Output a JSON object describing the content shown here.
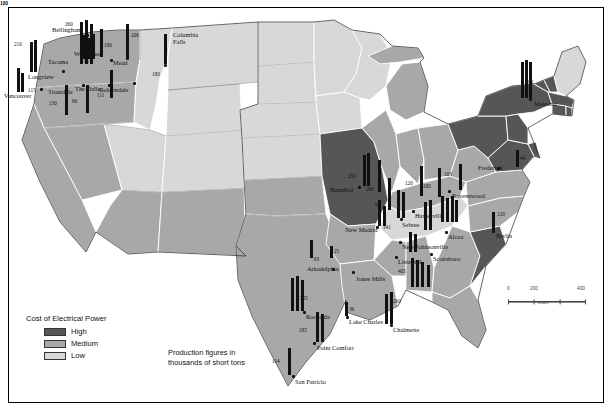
{
  "map": {
    "title": "US production map with electrical power cost choropleth",
    "legend": {
      "title": "Cost of Electrical Power",
      "items": [
        {
          "label": "High",
          "color": "#565656"
        },
        {
          "label": "Medium",
          "color": "#a8a8a8"
        },
        {
          "label": "Low",
          "color": "#d8d8d8"
        }
      ]
    },
    "note_lines": [
      "Production figures in",
      "thousands of short tons"
    ],
    "scale": {
      "ticks": [
        "0",
        "200",
        "400"
      ],
      "unit": "miles"
    },
    "colors": {
      "high": "#565656",
      "medium": "#a8a8a8",
      "low": "#d8d8d8",
      "border": "#ffffff",
      "outline": "#111111",
      "bar": "#111111",
      "water": "#ffffff"
    }
  },
  "cities": [
    {
      "name": "Bellingham",
      "x": 52,
      "y": 26,
      "dot_x": 86,
      "dot_y": 34,
      "anchor": "right"
    },
    {
      "name": "Longview",
      "x": 28,
      "y": 73,
      "dot_x": 62,
      "dot_y": 70,
      "anchor": "right"
    },
    {
      "name": "Vancouver",
      "x": 4,
      "y": 92,
      "dot_x": 40,
      "dot_y": 88,
      "anchor": "right"
    },
    {
      "name": "Tacoma",
      "x": 48,
      "y": 58,
      "dot_x": 80,
      "dot_y": 58,
      "anchor": "right"
    },
    {
      "name": "Troutdale",
      "x": 48,
      "y": 88,
      "dot_x": 82,
      "dot_y": 84,
      "anchor": "right"
    },
    {
      "name": "Wenatchee",
      "x": 74,
      "y": 50,
      "dot_x": 126,
      "dot_y": 57,
      "anchor": "left"
    },
    {
      "name": "Mead",
      "x": 113,
      "y": 59,
      "dot_x": 110,
      "dot_y": 59,
      "anchor": "left"
    },
    {
      "name": "The Dalles",
      "x": 75,
      "y": 85,
      "dot_x": 108,
      "dot_y": 84,
      "anchor": "left"
    },
    {
      "name": "Goldendale",
      "x": 99,
      "y": 86,
      "dot_x": 133,
      "dot_y": 82,
      "anchor": "left"
    },
    {
      "name": "Columbia Falls",
      "x": 173,
      "y": 31,
      "dot_x": 164,
      "dot_y": 64,
      "anchor": "left"
    },
    {
      "name": "Massena",
      "x": 534,
      "y": 100,
      "dot_x": 529,
      "dot_y": 98,
      "anchor": "left"
    },
    {
      "name": "Frederick",
      "x": 478,
      "y": 164,
      "dot_x": 497,
      "dot_y": 167,
      "anchor": "left"
    },
    {
      "name": "Ravenswood",
      "x": 452,
      "y": 192,
      "dot_x": 448,
      "dot_y": 190,
      "anchor": "left"
    },
    {
      "name": "Berlin",
      "x": 496,
      "y": 232,
      "dot_x": 492,
      "dot_y": 230,
      "anchor": "left"
    },
    {
      "name": "Hannibal",
      "x": 330,
      "y": 186,
      "dot_x": 358,
      "dot_y": 186,
      "anchor": "left"
    },
    {
      "name": "New Madrid",
      "x": 345,
      "y": 226,
      "dot_x": 376,
      "dot_y": 226,
      "anchor": "left"
    },
    {
      "name": "Hawesville",
      "x": 415,
      "y": 212,
      "dot_x": 412,
      "dot_y": 210,
      "anchor": "left"
    },
    {
      "name": "Sebree",
      "x": 402,
      "y": 221,
      "dot_x": 400,
      "dot_y": 218,
      "anchor": "left"
    },
    {
      "name": "Alcoa",
      "x": 448,
      "y": 233,
      "dot_x": 445,
      "dot_y": 231,
      "anchor": "left"
    },
    {
      "name": "New Johnsonville",
      "x": 402,
      "y": 243,
      "dot_x": 399,
      "dot_y": 241,
      "anchor": "left"
    },
    {
      "name": "Scottsboro",
      "x": 433,
      "y": 255,
      "dot_x": 430,
      "dot_y": 253,
      "anchor": "left"
    },
    {
      "name": "Listerhill",
      "x": 398,
      "y": 258,
      "dot_x": 395,
      "dot_y": 256,
      "anchor": "left"
    },
    {
      "name": "Jones Mills",
      "x": 356,
      "y": 275,
      "dot_x": 352,
      "dot_y": 271,
      "anchor": "left"
    },
    {
      "name": "Arkadelphia",
      "x": 307,
      "y": 265,
      "dot_x": 332,
      "dot_y": 268,
      "anchor": "left"
    },
    {
      "name": "Rockdale",
      "x": 306,
      "y": 313,
      "dot_x": 303,
      "dot_y": 311,
      "anchor": "left"
    },
    {
      "name": "Lake Charles",
      "x": 349,
      "y": 318,
      "dot_x": 346,
      "dot_y": 316,
      "anchor": "left"
    },
    {
      "name": "Chalmette",
      "x": 393,
      "y": 326,
      "dot_x": 390,
      "dot_y": 324,
      "anchor": "left"
    },
    {
      "name": "Point Comfort",
      "x": 317,
      "y": 344,
      "dot_x": 313,
      "dot_y": 342,
      "anchor": "left"
    },
    {
      "name": "San Patricio",
      "x": 295,
      "y": 378,
      "dot_x": 292,
      "dot_y": 375,
      "anchor": "left"
    }
  ],
  "bars": [
    {
      "value": "260",
      "x": 80,
      "y": 22,
      "h": 42,
      "lx": 65,
      "ly": 21,
      "lside": "left"
    },
    {
      "value": "",
      "x": 85,
      "y": 20,
      "h": 44,
      "lx": 0,
      "ly": 0,
      "lside": "none"
    },
    {
      "value": "",
      "x": 90,
      "y": 24,
      "h": 40,
      "lx": 0,
      "ly": 0,
      "lside": "none"
    },
    {
      "value": "210",
      "x": 30,
      "y": 42,
      "h": 30,
      "lx": 14,
      "ly": 41,
      "lside": "left"
    },
    {
      "value": "",
      "x": 34,
      "y": 40,
      "h": 32,
      "lx": 0,
      "ly": 0,
      "lside": "none"
    },
    {
      "value": "115",
      "x": 17,
      "y": 68,
      "h": 24,
      "lx": 28,
      "ly": 87,
      "lside": "right"
    },
    {
      "value": "",
      "x": 21,
      "y": 73,
      "h": 19,
      "lx": 0,
      "ly": 0,
      "lside": "none"
    },
    {
      "value": "81",
      "x": 82,
      "y": 35,
      "h": 24,
      "lx": 84,
      "ly": 58,
      "lside": "right"
    },
    {
      "value": "",
      "x": 87,
      "y": 38,
      "h": 21,
      "lx": 0,
      "ly": 0,
      "lside": "none"
    },
    {
      "value": "",
      "x": 92,
      "y": 34,
      "h": 25,
      "lx": 0,
      "ly": 0,
      "lside": "none"
    },
    {
      "value": "180",
      "x": 100,
      "y": 29,
      "h": 28,
      "lx": 104,
      "ly": 42,
      "lside": "right"
    },
    {
      "value": "206",
      "x": 126,
      "y": 24,
      "h": 35,
      "lx": 131,
      "ly": 32,
      "lside": "right"
    },
    {
      "value": "180",
      "x": 164,
      "y": 34,
      "h": 30,
      "lx": 152,
      "ly": 71,
      "lside": "left"
    },
    {
      "value": "130",
      "x": 65,
      "y": 85,
      "h": 30,
      "lx": 49,
      "ly": 100,
      "lside": "left"
    },
    {
      "value": "90",
      "x": 86,
      "y": 85,
      "h": 28,
      "lx": 72,
      "ly": 98,
      "lside": "left"
    },
    {
      "value": "111",
      "x": 110,
      "y": 70,
      "h": 28,
      "lx": 97,
      "ly": 92,
      "lside": "left"
    },
    {
      "value": "261",
      "x": 521,
      "y": 62,
      "h": 36,
      "lx": 526,
      "ly": 79,
      "lside": "right"
    },
    {
      "value": "",
      "x": 525,
      "y": 60,
      "h": 38,
      "lx": 0,
      "ly": 0,
      "lside": "none"
    },
    {
      "value": "",
      "x": 529,
      "y": 62,
      "h": 36,
      "lx": 0,
      "ly": 0,
      "lside": "none"
    },
    {
      "value": "44",
      "x": 516,
      "y": 150,
      "h": 17,
      "lx": 520,
      "ly": 155,
      "lside": "right"
    },
    {
      "value": "103",
      "x": 459,
      "y": 164,
      "h": 26,
      "lx": 444,
      "ly": 171,
      "lside": "left"
    },
    {
      "value": "120",
      "x": 420,
      "y": 166,
      "h": 30,
      "lx": 405,
      "ly": 180,
      "lside": "left"
    },
    {
      "value": "180",
      "x": 438,
      "y": 168,
      "h": 29,
      "lx": 423,
      "ly": 183,
      "lside": "left"
    },
    {
      "value": "120",
      "x": 492,
      "y": 212,
      "h": 18,
      "lx": 497,
      "ly": 211,
      "lside": "right"
    },
    {
      "value": "250",
      "x": 363,
      "y": 155,
      "h": 31,
      "lx": 348,
      "ly": 173,
      "lside": "left"
    },
    {
      "value": "",
      "x": 367,
      "y": 153,
      "h": 33,
      "lx": 0,
      "ly": 0,
      "lside": "none"
    },
    {
      "value": "280",
      "x": 378,
      "y": 160,
      "h": 32,
      "lx": 366,
      "ly": 186,
      "lside": "left"
    },
    {
      "value": "70",
      "x": 388,
      "y": 178,
      "h": 32,
      "lx": 374,
      "ly": 202,
      "lside": "left"
    },
    {
      "value": "141",
      "x": 378,
      "y": 200,
      "h": 26,
      "lx": 383,
      "ly": 224,
      "lside": "right"
    },
    {
      "value": "",
      "x": 383,
      "y": 206,
      "h": 20,
      "lx": 0,
      "ly": 0,
      "lside": "none"
    },
    {
      "value": "63",
      "x": 310,
      "y": 240,
      "h": 18,
      "lx": 314,
      "ly": 256,
      "lside": "right"
    },
    {
      "value": "25",
      "x": 330,
      "y": 246,
      "h": 12,
      "lx": 334,
      "ly": 248,
      "lside": "right"
    },
    {
      "value": "120",
      "x": 397,
      "y": 190,
      "h": 28,
      "lx": 0,
      "ly": 0,
      "lside": "none"
    },
    {
      "value": "",
      "x": 402,
      "y": 192,
      "h": 26,
      "lx": 0,
      "ly": 0,
      "lside": "none"
    },
    {
      "value": "",
      "x": 441,
      "y": 196,
      "h": 26,
      "lx": 0,
      "ly": 0,
      "lside": "none"
    },
    {
      "value": "",
      "x": 446,
      "y": 198,
      "h": 24,
      "lx": 0,
      "ly": 0,
      "lside": "none"
    },
    {
      "value": "",
      "x": 451,
      "y": 196,
      "h": 26,
      "lx": 0,
      "ly": 0,
      "lside": "none"
    },
    {
      "value": "",
      "x": 455,
      "y": 200,
      "h": 22,
      "lx": 0,
      "ly": 0,
      "lside": "none"
    },
    {
      "value": "",
      "x": 424,
      "y": 202,
      "h": 28,
      "lx": 0,
      "ly": 0,
      "lside": "none"
    },
    {
      "value": "",
      "x": 429,
      "y": 200,
      "h": 30,
      "lx": 0,
      "ly": 0,
      "lside": "none"
    },
    {
      "value": "",
      "x": 409,
      "y": 232,
      "h": 20,
      "lx": 0,
      "ly": 0,
      "lside": "none"
    },
    {
      "value": "",
      "x": 414,
      "y": 234,
      "h": 18,
      "lx": 0,
      "ly": 0,
      "lside": "none"
    },
    {
      "value": "405",
      "x": 411,
      "y": 258,
      "h": 29,
      "lx": 398,
      "ly": 268,
      "lside": "left"
    },
    {
      "value": "",
      "x": 416,
      "y": 260,
      "h": 27,
      "lx": 0,
      "ly": 0,
      "lside": "none"
    },
    {
      "value": "",
      "x": 421,
      "y": 262,
      "h": 25,
      "lx": 0,
      "ly": 0,
      "lside": "none"
    },
    {
      "value": "180",
      "x": 427,
      "y": 265,
      "h": 22,
      "lx": 0,
      "ly": 0,
      "lside": "none"
    },
    {
      "value": "285",
      "x": 291,
      "y": 278,
      "h": 33,
      "lx": 300,
      "ly": 295,
      "lside": "right"
    },
    {
      "value": "",
      "x": 296,
      "y": 276,
      "h": 35,
      "lx": 0,
      "ly": 0,
      "lside": "none"
    },
    {
      "value": "",
      "x": 301,
      "y": 280,
      "h": 31,
      "lx": 0,
      "ly": 0,
      "lside": "none"
    },
    {
      "value": "36",
      "x": 345,
      "y": 302,
      "h": 14,
      "lx": 349,
      "ly": 306,
      "lside": "right"
    },
    {
      "value": "260",
      "x": 385,
      "y": 294,
      "h": 30,
      "lx": 393,
      "ly": 298,
      "lside": "right"
    },
    {
      "value": "",
      "x": 390,
      "y": 292,
      "h": 32,
      "lx": 0,
      "ly": 0,
      "lside": "none"
    },
    {
      "value": "185",
      "x": 316,
      "y": 312,
      "h": 30,
      "lx": 299,
      "ly": 327,
      "lside": "left"
    },
    {
      "value": "",
      "x": 321,
      "y": 314,
      "h": 28,
      "lx": 0,
      "ly": 0,
      "lside": "none"
    },
    {
      "value": "114",
      "x": 288,
      "y": 348,
      "h": 27,
      "lx": 272,
      "ly": 358,
      "lside": "left"
    }
  ]
}
